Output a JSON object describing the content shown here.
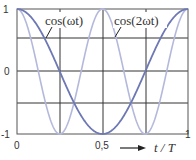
{
  "chart_data": {
    "type": "line",
    "title": "",
    "xlabel": "t / T",
    "ylabel": "",
    "xlim": [
      0,
      1
    ],
    "ylim": [
      -1,
      1
    ],
    "grid": true,
    "x_ticks": [
      "0",
      "0,5",
      "1"
    ],
    "y_ticks": [
      "1",
      "0",
      "-1"
    ],
    "x_grid": [
      0,
      0.25,
      0.5,
      0.75,
      1
    ],
    "y_grid": [
      -1,
      -0.5,
      0,
      0.5,
      1
    ],
    "series": [
      {
        "name": "cos(ωt)",
        "function": "cos(2π·t/T)",
        "color": "#6e78b4",
        "x": [
          0,
          0.125,
          0.25,
          0.375,
          0.5,
          0.625,
          0.75,
          0.875,
          1
        ],
        "values": [
          1,
          0.71,
          0,
          -0.71,
          -1,
          -0.71,
          0,
          0.71,
          1
        ]
      },
      {
        "name": "cos(2ωt)",
        "function": "cos(4π·t/T)",
        "color": "#b4b9dc",
        "x": [
          0,
          0.125,
          0.25,
          0.375,
          0.5,
          0.625,
          0.75,
          0.875,
          1
        ],
        "values": [
          1,
          0,
          -1,
          0,
          1,
          0,
          -1,
          0,
          1
        ]
      }
    ],
    "annotations": [
      "cos(ωt)",
      "cos(2ωt)"
    ],
    "legend": "none"
  },
  "labels": {
    "y_top": "1",
    "y_mid": "0",
    "y_bot": "-1",
    "x_left": "0",
    "x_mid": "0,5",
    "x_right": "1",
    "x_axis": "t / T",
    "ann1": "cos(ωt)",
    "ann2": "cos(2ωt)"
  }
}
